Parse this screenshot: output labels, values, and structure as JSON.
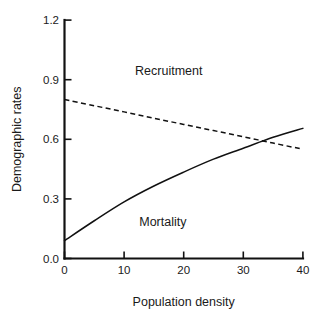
{
  "chart_data": {
    "type": "line",
    "title": "",
    "xlabel": "Population density",
    "ylabel": "Demographic rates",
    "xlim": [
      0,
      40
    ],
    "ylim": [
      0.0,
      1.2
    ],
    "grid": false,
    "legend_position": "inline-annotations",
    "xticks": [
      "0",
      "10",
      "20",
      "30",
      "40"
    ],
    "xtick_values": [
      0,
      10,
      20,
      30,
      40
    ],
    "yticks": [
      "0.0",
      "0.3",
      "0.6",
      "0.9",
      "1.2"
    ],
    "ytick_values": [
      0.0,
      0.3,
      0.6,
      0.9,
      1.2
    ],
    "x": [
      0,
      5,
      10,
      15,
      20,
      25,
      30,
      35,
      40
    ],
    "series": [
      {
        "name": "Mortality",
        "style": "solid",
        "color": "#111111",
        "label_text": "Mortality",
        "label_x": 16.5,
        "label_y": 0.165,
        "values": [
          0.09,
          0.19,
          0.285,
          0.365,
          0.435,
          0.5,
          0.555,
          0.61,
          0.655
        ]
      },
      {
        "name": "Recruitment",
        "style": "dashed",
        "color": "#111111",
        "label_text": "Recruitment",
        "label_x": 17.5,
        "label_y": 0.925,
        "values": [
          0.8,
          0.769,
          0.738,
          0.706,
          0.675,
          0.644,
          0.613,
          0.581,
          0.55
        ]
      }
    ],
    "annotations": [
      {
        "name": "crossing-point",
        "x": 32.5,
        "y": 0.6
      }
    ]
  }
}
